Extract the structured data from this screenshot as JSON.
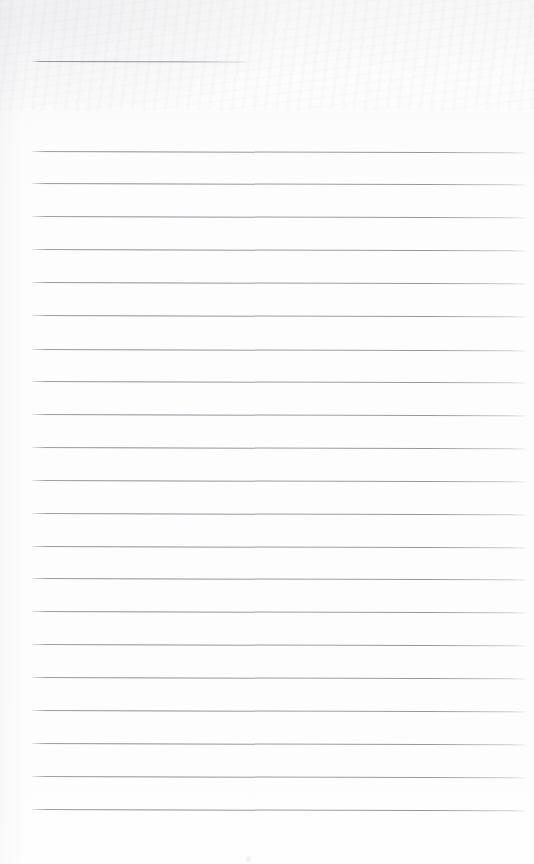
{
  "document": {
    "kind": "scanned-lined-notepad-page",
    "title": "",
    "body_text": "",
    "visible_text": "",
    "page_number": "",
    "notes": "Blank ruled writing sheet; no handwriting, typed text, headings, numbers or marks are present anywhere on the page."
  },
  "paper": {
    "background_color": "#fdfdfd",
    "top_tint_color": "#f7f7f8",
    "width": 534,
    "height": 864
  },
  "rules": {
    "line_color": "#8e8e96",
    "line_thickness_px": 1,
    "left_margin_x": 32,
    "right_edge_x": 526,
    "line_spacing_px": 32.8,
    "tilt_degrees": 0.16,
    "header_rule": {
      "label": "header-rule",
      "x": 32,
      "y": 61,
      "width": 216
    },
    "body_rules": [
      {
        "label": "rule-1",
        "y": 151
      },
      {
        "label": "rule-2",
        "y": 183
      },
      {
        "label": "rule-3",
        "y": 216
      },
      {
        "label": "rule-4",
        "y": 249
      },
      {
        "label": "rule-5",
        "y": 282
      },
      {
        "label": "rule-6",
        "y": 315
      },
      {
        "label": "rule-7",
        "y": 349
      },
      {
        "label": "rule-8",
        "y": 381
      },
      {
        "label": "rule-9",
        "y": 414
      },
      {
        "label": "rule-10",
        "y": 447
      },
      {
        "label": "rule-11",
        "y": 480
      },
      {
        "label": "rule-12",
        "y": 513
      },
      {
        "label": "rule-13",
        "y": 546
      },
      {
        "label": "rule-14",
        "y": 578
      },
      {
        "label": "rule-15",
        "y": 611
      },
      {
        "label": "rule-16",
        "y": 644
      },
      {
        "label": "rule-17",
        "y": 677
      },
      {
        "label": "rule-18",
        "y": 710
      },
      {
        "label": "rule-19",
        "y": 743
      },
      {
        "label": "rule-20",
        "y": 776
      },
      {
        "label": "rule-21",
        "y": 809
      }
    ]
  },
  "scan_artifacts": [
    {
      "label": "top-left-smudge",
      "x": -40,
      "y": -50,
      "width": 320,
      "height": 170
    },
    {
      "label": "top-noise-band",
      "x": 0,
      "y": 0,
      "width": 534,
      "height": 110
    },
    {
      "label": "left-edge-shade",
      "x": 0,
      "y": 0,
      "width": 26,
      "height": 864
    },
    {
      "label": "speck-bottom",
      "x": 246,
      "y": 856,
      "width": 5,
      "height": 6
    }
  ]
}
